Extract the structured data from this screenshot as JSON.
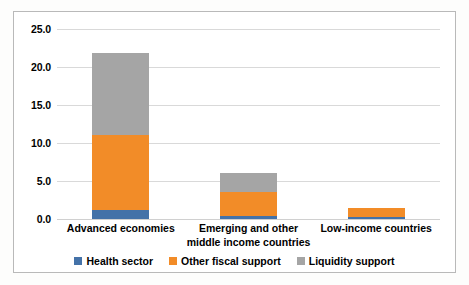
{
  "chart_data": {
    "type": "bar",
    "subtype": "stacked-column",
    "title": "",
    "xlabel": "",
    "ylabel": "",
    "ylim": [
      0.0,
      25.0
    ],
    "yticks": [
      "0.0",
      "5.0",
      "10.0",
      "15.0",
      "20.0",
      "25.0"
    ],
    "ytick_values": [
      0.0,
      5.0,
      10.0,
      15.0,
      20.0,
      25.0
    ],
    "grid": true,
    "legend_position": "bottom",
    "categories": [
      "Advanced economies",
      "Emerging and other middle income countries",
      "Low-income countries"
    ],
    "series": [
      {
        "name": "Health sector",
        "color": "#4472a8",
        "values": [
          1.2,
          0.4,
          0.2
        ]
      },
      {
        "name": "Other fiscal support",
        "color": "#f28c28",
        "values": [
          9.8,
          3.2,
          1.3
        ]
      },
      {
        "name": "Liquidity support",
        "color": "#a5a5a5",
        "values": [
          10.8,
          2.5,
          0.0
        ]
      }
    ],
    "totals": [
      21.8,
      6.1,
      1.5
    ]
  },
  "legend": {
    "items": [
      {
        "label": "Health sector",
        "color": "#4472a8"
      },
      {
        "label": "Other fiscal support",
        "color": "#f28c28"
      },
      {
        "label": "Liquidity support",
        "color": "#a5a5a5"
      }
    ]
  }
}
